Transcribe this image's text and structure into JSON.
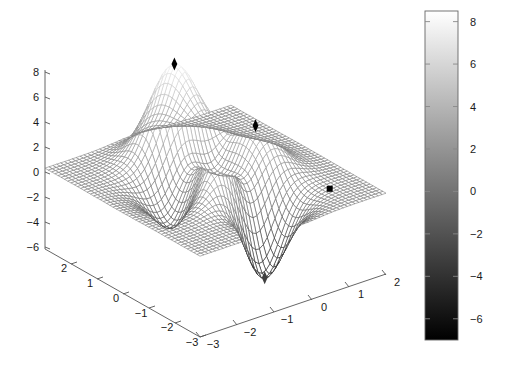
{
  "figure": {
    "background": "#ffffff",
    "type": "matlab-mesh-surface-figure"
  },
  "chart_data": {
    "type": "surface",
    "title": "",
    "subtitle": "",
    "xlabel": "",
    "ylabel": "",
    "zlabel": "",
    "function": "peaks",
    "formula": "z = 3(1-x)^2 e^(-x^2-(y+1)^2) - 10(x/5 - x^3 - y^5) e^(-x^2-y^2) - (1/3) e^(-(x+1)^2-y^2)",
    "rendering": "wireframe mesh with hidden-line removal, grayscale colormap",
    "grid": false,
    "view": {
      "azimuth": -37.5,
      "elevation": 30
    },
    "mesh_resolution": {
      "nx": 49,
      "ny": 49
    },
    "axes": {
      "x": {
        "label": "",
        "lim": [
          -3,
          3
        ],
        "ticks": [
          -3,
          -2,
          -1,
          0,
          1,
          2
        ],
        "tick_labels": [
          "−3",
          "−2",
          "−1",
          "0",
          "1",
          "2"
        ]
      },
      "y": {
        "label": "",
        "lim": [
          -3,
          3
        ],
        "ticks": [
          2,
          1,
          0,
          -1,
          -2,
          -3
        ],
        "tick_labels": [
          "2",
          "1",
          "0",
          "−1",
          "−2",
          "−3"
        ]
      },
      "z": {
        "label": "",
        "lim": [
          -7,
          8.5
        ],
        "ticks": [
          8,
          6,
          4,
          2,
          0,
          -2,
          -4,
          -6
        ],
        "tick_labels": [
          "8",
          "6",
          "4",
          "2",
          "0",
          "−2",
          "−4",
          "−6"
        ]
      }
    },
    "colorbar": {
      "orientation": "vertical",
      "position": "right",
      "colormap": "gray",
      "clim": [
        -7,
        8.5
      ],
      "low_color": "#000000",
      "high_color": "#ffffff",
      "ticks": [
        8,
        6,
        4,
        2,
        0,
        -2,
        -4,
        -6
      ],
      "tick_labels": [
        "8",
        "6",
        "4",
        "2",
        "0",
        "−2",
        "−4",
        "−6"
      ]
    },
    "markers": [
      {
        "name": "global-maximum",
        "x": -0.01,
        "y": 1.58,
        "z": 8.11,
        "symbol": "diamond",
        "color": "#000000"
      },
      {
        "name": "local-maximum",
        "x": 1.29,
        "y": -0.0,
        "z": 3.59,
        "symbol": "diamond",
        "color": "#000000"
      },
      {
        "name": "saddle-point",
        "x": 2.1,
        "y": -1.9,
        "z": -0.2,
        "symbol": "square",
        "color": "#000000"
      },
      {
        "name": "global-minimum",
        "x": 0.23,
        "y": -1.63,
        "z": -6.55,
        "symbol": "diamond",
        "color": "#404040"
      }
    ]
  }
}
